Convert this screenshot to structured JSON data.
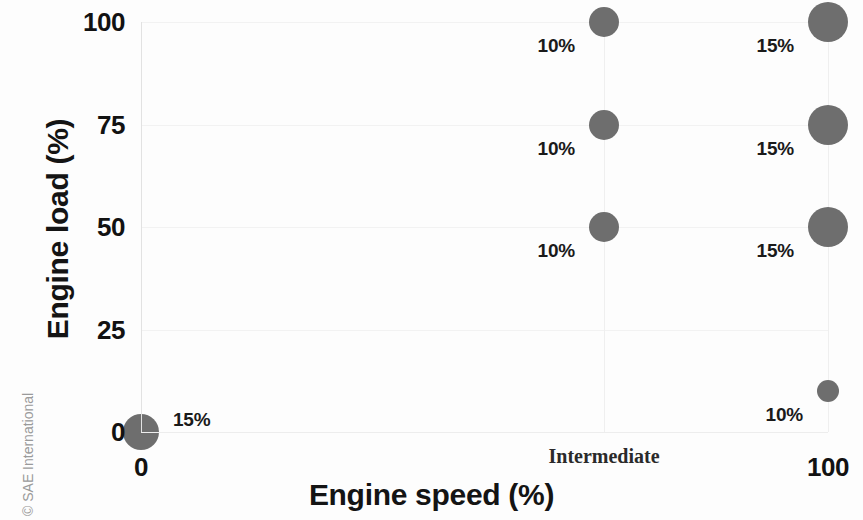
{
  "chart_data": {
    "type": "scatter",
    "title": "",
    "xlabel": "Engine speed (%)",
    "ylabel": "Engine load (%)",
    "xlim": [
      0,
      100
    ],
    "ylim": [
      0,
      100
    ],
    "grid": true,
    "legend": "none",
    "x_tick_labels": [
      "0",
      "Intermediate",
      "100"
    ],
    "x_tick_values": [
      0,
      67.4,
      100
    ],
    "y_tick_labels": [
      "0",
      "25",
      "50",
      "75",
      "100"
    ],
    "y_tick_values": [
      0,
      25,
      50,
      75,
      100
    ],
    "marker_color": "#6e6e6e",
    "points": [
      {
        "speed_label": "0",
        "x": 0,
        "load": 0,
        "weight_pct": 15,
        "data_label": "15%",
        "marker_px": 36
      },
      {
        "speed_label": "Intermediate",
        "x": 67.4,
        "load": 50,
        "weight_pct": 10,
        "data_label": "10%",
        "marker_px": 30
      },
      {
        "speed_label": "Intermediate",
        "x": 67.4,
        "load": 75,
        "weight_pct": 10,
        "data_label": "10%",
        "marker_px": 30
      },
      {
        "speed_label": "Intermediate",
        "x": 67.4,
        "load": 100,
        "weight_pct": 10,
        "data_label": "10%",
        "marker_px": 30
      },
      {
        "speed_label": "100",
        "x": 100,
        "load": 10,
        "weight_pct": 10,
        "data_label": "10%",
        "marker_px": 22
      },
      {
        "speed_label": "100",
        "x": 100,
        "load": 50,
        "weight_pct": 15,
        "data_label": "15%",
        "marker_px": 40
      },
      {
        "speed_label": "100",
        "x": 100,
        "load": 75,
        "weight_pct": 15,
        "data_label": "15%",
        "marker_px": 40
      },
      {
        "speed_label": "100",
        "x": 100,
        "load": 100,
        "weight_pct": 15,
        "data_label": "15%",
        "marker_px": 40
      }
    ]
  },
  "credit": {
    "text": "© SAE International"
  }
}
